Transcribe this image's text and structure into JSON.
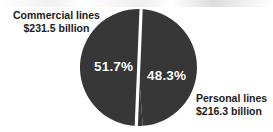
{
  "figure": {
    "background_color": "#ffffff",
    "slice_color": "#373737",
    "divider_color": "#ffffff",
    "label_color": "#1b1b1b",
    "pct_label_color": "#ffffff"
  },
  "labels": {
    "commercial": {
      "name": "Commercial lines",
      "value": "$231.5 billion",
      "pct": "51.7%"
    },
    "personal": {
      "name": "Personal lines",
      "value": "$216.3 billion",
      "pct": "48.3%"
    }
  },
  "chart_data": {
    "type": "pie",
    "title": "",
    "subtitle": "",
    "xlabel": "",
    "ylabel": "",
    "grid": false,
    "legend": "callout-labels",
    "units": "billions of US dollars",
    "categories": [
      "Commercial lines",
      "Personal lines"
    ],
    "values": [
      231.5,
      216.3
    ],
    "percentages": [
      51.7,
      48.3
    ],
    "value_labels": [
      "$231.5 billion",
      "$216.3 billion"
    ],
    "percent_labels": [
      "51.7%",
      "48.3%"
    ],
    "total": 447.8,
    "colors": [
      "#373737",
      "#373737"
    ],
    "slice_separator": {
      "color": "#ffffff",
      "width_px": 3
    },
    "start_angle_deg": 0,
    "direction": "counterclockwise",
    "annotations": [
      {
        "target": "Commercial lines",
        "position": "upper-left",
        "text": "Commercial lines $231.5 billion"
      },
      {
        "target": "Personal lines",
        "position": "lower-right",
        "text": "Personal lines $216.3 billion"
      }
    ]
  }
}
